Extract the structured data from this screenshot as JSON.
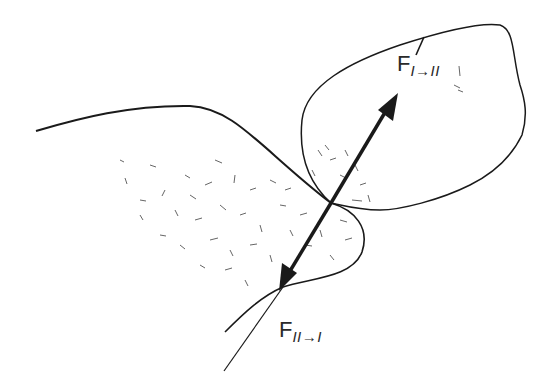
{
  "diagram": {
    "type": "contact-forces-between-two-bodies",
    "bodies": [
      {
        "id": "I",
        "description": "left body, stippled/shaded, lower-left"
      },
      {
        "id": "II",
        "description": "right body, outlined blob, upper-right"
      }
    ],
    "contact_point": {
      "x": 331,
      "y": 203
    },
    "forces": [
      {
        "label": "F",
        "subscript": "I→II",
        "direction": "up-right, toward body II"
      },
      {
        "label": "F",
        "subscript": "II→I",
        "direction": "down-left, toward body I"
      }
    ],
    "colors": {
      "line": "#1a1a1a",
      "stipple": "#333333",
      "background": "#ffffff"
    }
  },
  "labels": {
    "force_on_II": {
      "main": "F",
      "sub": "I→II"
    },
    "force_on_I": {
      "main": "F",
      "sub": "II→I"
    }
  }
}
